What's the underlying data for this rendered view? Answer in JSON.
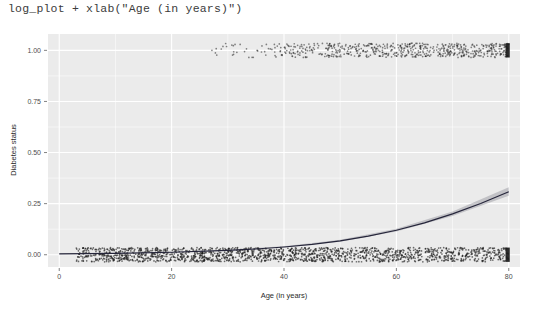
{
  "console": {
    "code_line": "log_plot + xlab(\"Age (in years)\")"
  },
  "plot": {
    "y_axis_title": "Diabetes status",
    "x_axis_title": "Age (in years)",
    "panel_background": "#ebebeb",
    "gridline_color": "#ffffff",
    "point_color": "#1a1a1a",
    "curve_color": "#25253a",
    "ribbon_color": "#a0a0a8"
  },
  "chart_data": {
    "type": "scatter",
    "title": "",
    "subtitle": "",
    "xlabel": "Age (in years)",
    "ylabel": "Diabetes status",
    "xlim": [
      -2,
      82
    ],
    "ylim": [
      -0.06,
      1.08
    ],
    "xticks": [
      0,
      20,
      40,
      60,
      80
    ],
    "xtick_labels": [
      "0",
      "20",
      "40",
      "60",
      "80"
    ],
    "yticks": [
      0.0,
      0.25,
      0.5,
      0.75,
      1.0
    ],
    "ytick_labels": [
      "0.00",
      "0.25",
      "0.50",
      "0.75",
      "1.00"
    ],
    "grid": true,
    "grid_major_only_on_ticks": true,
    "legend": "none",
    "series": [
      {
        "name": "Diabetes status = 0 (jittered rug band)",
        "type": "jittered-points",
        "y_center": 0.0,
        "y_jitter_halfwidth": 0.035,
        "x_range": [
          3,
          80
        ],
        "x_density_profile": [
          {
            "x": 5,
            "density": 0.95
          },
          {
            "x": 10,
            "density": 1.0
          },
          {
            "x": 20,
            "density": 1.0
          },
          {
            "x": 30,
            "density": 1.0
          },
          {
            "x": 40,
            "density": 0.98
          },
          {
            "x": 50,
            "density": 0.92
          },
          {
            "x": 60,
            "density": 0.85
          },
          {
            "x": 70,
            "density": 0.78
          },
          {
            "x": 78,
            "density": 0.72
          },
          {
            "x": 80,
            "density": 1.0
          }
        ],
        "approx_point_count": 1700
      },
      {
        "name": "Diabetes status = 1 (jittered rug band)",
        "type": "jittered-points",
        "y_center": 1.0,
        "y_jitter_halfwidth": 0.035,
        "x_range": [
          27,
          80
        ],
        "x_density_profile": [
          {
            "x": 27,
            "density": 0.04
          },
          {
            "x": 32,
            "density": 0.1
          },
          {
            "x": 38,
            "density": 0.22
          },
          {
            "x": 44,
            "density": 0.45
          },
          {
            "x": 50,
            "density": 0.62
          },
          {
            "x": 56,
            "density": 0.72
          },
          {
            "x": 62,
            "density": 0.78
          },
          {
            "x": 68,
            "density": 0.8
          },
          {
            "x": 74,
            "density": 0.8
          },
          {
            "x": 80,
            "density": 1.0
          }
        ],
        "approx_point_count": 620
      },
      {
        "name": "Logistic regression fit",
        "type": "line",
        "x": [
          0,
          10,
          20,
          30,
          35,
          40,
          45,
          50,
          55,
          60,
          65,
          70,
          75,
          80
        ],
        "y": [
          0.004,
          0.007,
          0.012,
          0.021,
          0.028,
          0.038,
          0.051,
          0.068,
          0.091,
          0.12,
          0.156,
          0.2,
          0.251,
          0.308
        ]
      },
      {
        "name": "95% confidence ribbon",
        "type": "ribbon",
        "x": [
          0,
          10,
          20,
          30,
          40,
          50,
          60,
          70,
          80
        ],
        "ymin": [
          0.003,
          0.006,
          0.01,
          0.019,
          0.035,
          0.064,
          0.114,
          0.19,
          0.288
        ],
        "ymax": [
          0.006,
          0.009,
          0.014,
          0.024,
          0.042,
          0.073,
          0.127,
          0.211,
          0.33
        ]
      }
    ]
  }
}
